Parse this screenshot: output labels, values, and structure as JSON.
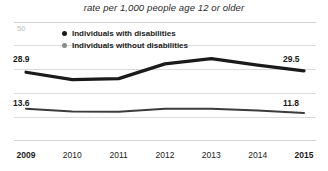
{
  "chart_data": {
    "type": "line",
    "title": "rate per 1,000 people age 12 or older",
    "xlabel": "",
    "ylabel": "",
    "categories": [
      "2009",
      "2010",
      "2011",
      "2012",
      "2013",
      "2014",
      "2015"
    ],
    "ylim": [
      0,
      50
    ],
    "grid": true,
    "legend_position": "top-left-inside",
    "y_axis_top_tick": "50",
    "series": [
      {
        "name": "Individuals with disabilities",
        "color": "#1a1a1a",
        "marker_color": "#1a1a1a",
        "values": [
          28.9,
          25.8,
          26.2,
          32.4,
          34.6,
          31.9,
          29.5
        ],
        "start_label": "28.9",
        "end_label": "29.5"
      },
      {
        "name": "Individuals without disabilities",
        "color": "#3c3c3c",
        "marker_color": "#8a8a8a",
        "values": [
          13.6,
          12.4,
          12.3,
          13.6,
          13.5,
          12.8,
          11.8
        ],
        "start_label": "13.6",
        "end_label": "11.8"
      }
    ],
    "annotations": [
      {
        "text": "28.9",
        "series": "Individuals with disabilities",
        "category": "2009"
      },
      {
        "text": "29.5",
        "series": "Individuals with disabilities",
        "category": "2015"
      },
      {
        "text": "13.6",
        "series": "Individuals without disabilities",
        "category": "2009"
      },
      {
        "text": "11.8",
        "series": "Individuals without disabilities",
        "category": "2015"
      }
    ]
  }
}
